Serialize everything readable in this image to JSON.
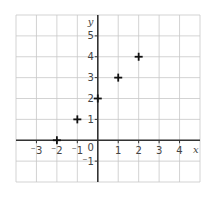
{
  "chart_data": {
    "type": "scatter",
    "title": "",
    "xlabel": "x",
    "ylabel": "y",
    "xlim": [
      -4,
      5
    ],
    "ylim": [
      -2,
      6
    ],
    "grid": true,
    "x_ticks": [
      -3,
      -2,
      -1,
      1,
      2,
      3,
      4
    ],
    "x_tick_labels": [
      "⁻3",
      "⁻2",
      "⁻1",
      "1",
      "2",
      "3",
      "4"
    ],
    "y_ticks": [
      -1,
      1,
      2,
      3,
      4,
      5
    ],
    "y_tick_labels": [
      "⁻1",
      "1",
      "2",
      "3",
      "4",
      "5"
    ],
    "origin_label": "0",
    "marker": "+",
    "series": [
      {
        "name": "points",
        "points": [
          {
            "x": -2,
            "y": 0
          },
          {
            "x": -1,
            "y": 1
          },
          {
            "x": 0,
            "y": 2
          },
          {
            "x": 1,
            "y": 3
          },
          {
            "x": 2,
            "y": 4
          }
        ]
      }
    ]
  },
  "colors": {
    "grid": "#c8c8c8",
    "axis": "#333333",
    "marker": "#111111",
    "text": "#444444",
    "background": "#ffffff"
  }
}
